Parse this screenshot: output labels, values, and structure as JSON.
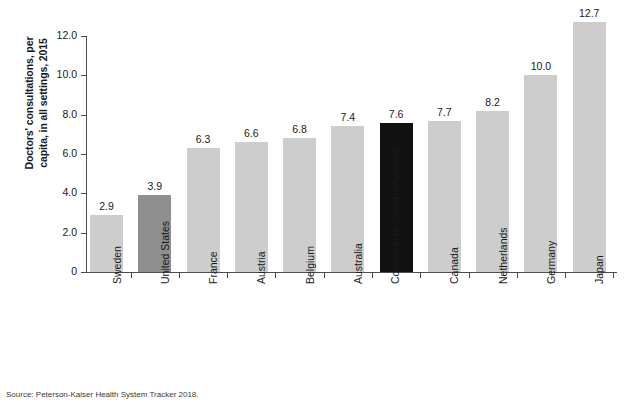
{
  "chart_data": {
    "type": "bar",
    "title": "",
    "xlabel": "",
    "ylabel": "Doctors' consultations, per capita, in all settings, 2015",
    "ylabel_lines": [
      "Doctors' consultations, per",
      "capita, in all settings, 2015"
    ],
    "ylim": [
      0,
      12
    ],
    "yticks": [
      "0",
      "2.0",
      "4.0",
      "6.0",
      "8.0",
      "10.0",
      "12.0"
    ],
    "ytick_values": [
      0,
      2,
      4,
      6,
      8,
      10,
      12
    ],
    "grid": false,
    "legend": "none",
    "categories": [
      "Sweden",
      "United States",
      "France",
      "Austria",
      "Belgium",
      "Australia",
      "Comparable Country Average",
      "Canada",
      "Netherlands",
      "Germany",
      "Japan"
    ],
    "category_lines": [
      [
        "Sweden"
      ],
      [
        "United States"
      ],
      [
        "France"
      ],
      [
        "Austria"
      ],
      [
        "Belgium"
      ],
      [
        "Australia"
      ],
      [
        "Comparable Country",
        "Average"
      ],
      [
        "Canada"
      ],
      [
        "Netherlands"
      ],
      [
        "Germany"
      ],
      [
        "Japan"
      ]
    ],
    "values": [
      2.9,
      3.9,
      6.3,
      6.6,
      6.8,
      7.4,
      7.6,
      7.7,
      8.2,
      10.0,
      12.7
    ],
    "value_labels": [
      "2.9",
      "3.9",
      "6.3",
      "6.6",
      "6.8",
      "7.4",
      "7.6",
      "7.7",
      "8.2",
      "10.0",
      "12.7"
    ],
    "bar_colors": [
      "#cdcdcd",
      "#8f8f8f",
      "#cdcdcd",
      "#cdcdcd",
      "#cdcdcd",
      "#cdcdcd",
      "#111111",
      "#cdcdcd",
      "#cdcdcd",
      "#cdcdcd",
      "#cdcdcd"
    ],
    "colors": {
      "default_bar": "#cdcdcd",
      "highlight_us": "#8f8f8f",
      "highlight_average": "#111111",
      "axis": "#4d4d4d",
      "text": "#1a1a1a",
      "background": "#ffffff"
    }
  },
  "source": {
    "text": "Source: Peterson-Kaiser Health System Tracker 2018."
  }
}
